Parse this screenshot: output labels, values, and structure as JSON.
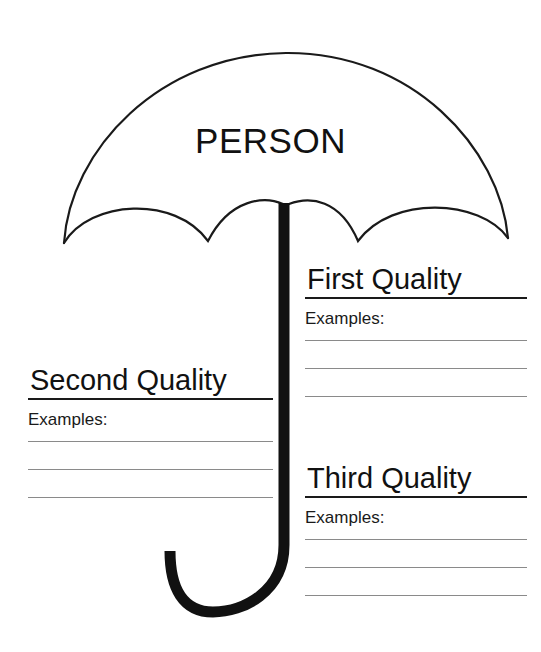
{
  "worksheet": {
    "title": "Umbrella Character Traits Graphic Organizer",
    "topic_label": "PERSON",
    "ink_color": "#111111",
    "rule_color": "#1a1a1a",
    "write_line_color": "#8a8a8a",
    "page_background": "#ffffff"
  },
  "umbrella": {
    "canopy_name": "umbrella-canopy",
    "shaft_name": "umbrella-shaft",
    "handle_name": "umbrella-handle",
    "scallop_count": 4,
    "stroke_color": "#1a1a1a"
  },
  "blocks": [
    {
      "id": "first",
      "title": "First Quality",
      "examples_label": "Examples:",
      "line_count": 3
    },
    {
      "id": "second",
      "title": "Second Quality",
      "examples_label": "Examples:",
      "line_count": 3
    },
    {
      "id": "third",
      "title": "Third Quality",
      "examples_label": "Examples:",
      "line_count": 3
    }
  ]
}
